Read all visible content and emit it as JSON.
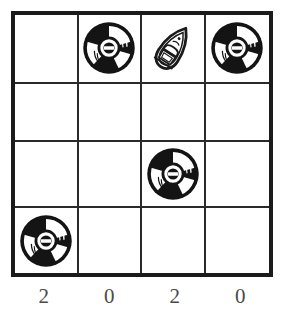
{
  "puzzle": {
    "type": "grid-logic-puzzle",
    "grid": {
      "rows": 4,
      "columns": 4,
      "border_color": "#1b1b1b",
      "line_color": "#2a2a2a",
      "background_color": "#ffffff",
      "cells": [
        [
          {
            "row": 1,
            "col": 1,
            "icon": "",
            "icon_label": "empty-cell"
          },
          {
            "row": 1,
            "col": 2,
            "icon": "cd-icon",
            "icon_label": "compact-disc"
          },
          {
            "row": 1,
            "col": 3,
            "icon": "boat-icon",
            "icon_label": "speedboat"
          },
          {
            "row": 1,
            "col": 4,
            "icon": "cd-icon",
            "icon_label": "compact-disc"
          }
        ],
        [
          {
            "row": 2,
            "col": 1,
            "icon": "",
            "icon_label": "empty-cell"
          },
          {
            "row": 2,
            "col": 2,
            "icon": "",
            "icon_label": "empty-cell"
          },
          {
            "row": 2,
            "col": 3,
            "icon": "",
            "icon_label": "empty-cell"
          },
          {
            "row": 2,
            "col": 4,
            "icon": "",
            "icon_label": "empty-cell"
          }
        ],
        [
          {
            "row": 3,
            "col": 1,
            "icon": "",
            "icon_label": "empty-cell"
          },
          {
            "row": 3,
            "col": 2,
            "icon": "",
            "icon_label": "empty-cell"
          },
          {
            "row": 3,
            "col": 3,
            "icon": "cd-icon",
            "icon_label": "compact-disc"
          },
          {
            "row": 3,
            "col": 4,
            "icon": "",
            "icon_label": "empty-cell"
          }
        ],
        [
          {
            "row": 4,
            "col": 1,
            "icon": "cd-icon",
            "icon_label": "compact-disc"
          },
          {
            "row": 4,
            "col": 2,
            "icon": "",
            "icon_label": "empty-cell"
          },
          {
            "row": 4,
            "col": 3,
            "icon": "",
            "icon_label": "empty-cell"
          },
          {
            "row": 4,
            "col": 4,
            "icon": "",
            "icon_label": "empty-cell"
          }
        ]
      ]
    },
    "column_labels": [
      "2",
      "0",
      "2",
      "0"
    ],
    "label_color": "#4a4a4a"
  }
}
